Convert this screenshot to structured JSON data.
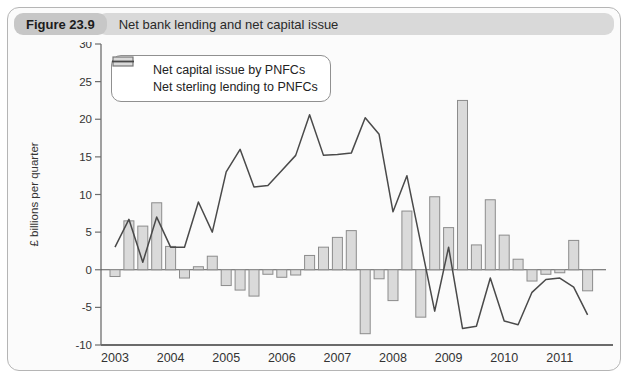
{
  "header": {
    "figure_label": "Figure 23.9",
    "title": "Net bank lending and net capital issue"
  },
  "chart_data": {
    "type": "combo",
    "title": "Net bank lending and net capital issue",
    "ylabel": "£ billions per quarter",
    "ylim": [
      -10,
      30
    ],
    "ytick_step": 5,
    "grid": false,
    "legend_position": "top-left",
    "x_years": [
      2003,
      2004,
      2005,
      2006,
      2007,
      2008,
      2009,
      2010,
      2011
    ],
    "quarters_per_year": 4,
    "n_quarters": 35,
    "x_range_note": "quarterly data 2003 Q1 to 2011 Q3",
    "series": [
      {
        "name": "Net capital issue by PNFCs",
        "type": "bar",
        "values": [
          -0.9,
          6.5,
          5.8,
          8.9,
          3.1,
          -1.1,
          0.4,
          1.8,
          -2.1,
          -2.7,
          -3.5,
          -0.6,
          -1.0,
          -0.7,
          1.9,
          3.0,
          4.3,
          5.2,
          -8.5,
          -1.2,
          -4.1,
          7.8,
          -6.3,
          9.7,
          5.6,
          22.5,
          3.3,
          9.3,
          4.6,
          1.4,
          -1.5,
          -0.6,
          -0.4,
          3.9,
          -2.8
        ]
      },
      {
        "name": "Net sterling lending to PNFCs",
        "type": "line",
        "values": [
          3.0,
          6.7,
          1.0,
          7.0,
          3.0,
          3.0,
          9.0,
          5.0,
          13.0,
          16.0,
          11.0,
          11.2,
          13.2,
          15.2,
          20.6,
          15.2,
          15.3,
          15.5,
          20.2,
          18.0,
          7.7,
          12.5,
          3.5,
          -5.5,
          3.0,
          -7.8,
          -7.5,
          -1.1,
          -6.8,
          -7.3,
          -3.0,
          -1.3,
          -1.1,
          -2.3,
          -6.0
        ]
      }
    ],
    "colors": {
      "bar_fill": "#dadada",
      "bar_stroke": "#8c8c8c",
      "line": "#4a4a4a",
      "axis": "#6e6e6e",
      "text": "#333333",
      "header_pill_bg": "#c7c7c7",
      "header_bar_bg": "#d9d9d9",
      "panel_border": "#b5b5b5",
      "panel_bg": "#fbfbfb"
    }
  }
}
